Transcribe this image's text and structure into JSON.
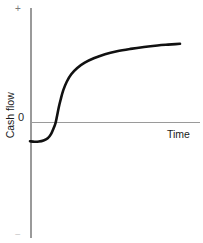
{
  "chart_data": {
    "type": "line",
    "title": "",
    "subtitle": "",
    "xlabel": "Time",
    "ylabel": "Cash flow",
    "grid": false,
    "legend": null,
    "axis_tick_labels": {
      "y_top": "+",
      "y_zero": "0",
      "y_bottom": "−"
    },
    "xlim": [
      0,
      1
    ],
    "ylim": [
      -1,
      1
    ],
    "zero_crossing_x": 0.175,
    "annotations": [],
    "series": [
      {
        "name": "Cumulative cash flow",
        "color": "#111111",
        "x": [
          0.0,
          0.03,
          0.06,
          0.09,
          0.118,
          0.14,
          0.158,
          0.17,
          0.18,
          0.192,
          0.205,
          0.222,
          0.245,
          0.275,
          0.315,
          0.365,
          0.425,
          0.5,
          0.58,
          0.67,
          0.76,
          0.85,
          0.92,
          0.97,
          1.0
        ],
        "y": [
          -0.175,
          -0.18,
          -0.178,
          -0.168,
          -0.148,
          -0.11,
          -0.055,
          -0.01,
          0.055,
          0.14,
          0.215,
          0.3,
          0.38,
          0.45,
          0.51,
          0.56,
          0.602,
          0.64,
          0.668,
          0.69,
          0.708,
          0.722,
          0.73,
          0.735,
          0.738
        ]
      }
    ]
  },
  "ylabel_text": "Cash flow",
  "xlabel_text": "Time",
  "plus_text": "+",
  "minus_text": "−",
  "zero_text": "0"
}
